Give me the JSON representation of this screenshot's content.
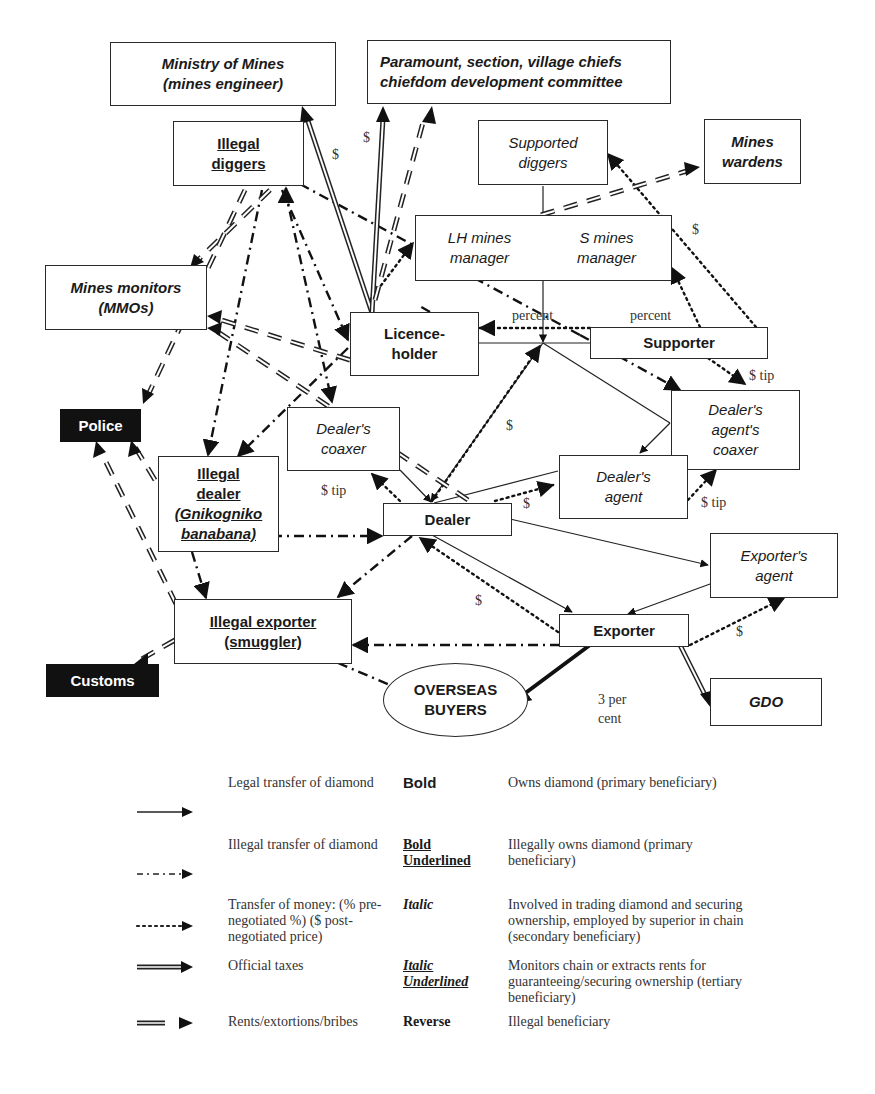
{
  "diagram": {
    "nodes": {
      "ministry": {
        "line1": "Ministry of Mines",
        "line2": "(mines engineer)",
        "style": "italic-bold"
      },
      "chiefs": {
        "line1": "Paramount, section, village chiefs",
        "line2": "chiefdom development committee",
        "style": "italic-bold"
      },
      "illegal_diggers": {
        "line1": "Illegal",
        "line2": "diggers",
        "style": "bold-underlined"
      },
      "supported_diggers": {
        "line1": "Supported",
        "line2": "diggers",
        "style": "italic"
      },
      "mines_wardens": {
        "line1": "Mines",
        "line2": "wardens",
        "style": "italic-bold"
      },
      "lh_mines_manager": {
        "line1": "LH mines",
        "line2": "manager",
        "style": "italic"
      },
      "s_mines_manager": {
        "line1": "S mines",
        "line2": "manager",
        "style": "italic"
      },
      "mines_monitors": {
        "line1": "Mines monitors",
        "line2": "(MMOs)",
        "style": "italic-bold"
      },
      "licence_holder": {
        "line1": "Licence-",
        "line2": "holder",
        "style": "bold"
      },
      "supporter": {
        "line1": "Supporter",
        "style": "bold"
      },
      "police": {
        "line1": "Police",
        "style": "reverse"
      },
      "dealers_coaxer": {
        "line1": "Dealer's",
        "line2": "coaxer",
        "style": "italic"
      },
      "dealers_agents_coaxer": {
        "line1": "Dealer's",
        "line2": "agent's",
        "line3": "coaxer",
        "style": "italic"
      },
      "illegal_dealer": {
        "line1": "Illegal",
        "line2": "dealer",
        "line3": "(Gnikogniko",
        "line4": "banabana)",
        "style": "bold-underlined"
      },
      "dealers_agent": {
        "line1": "Dealer's",
        "line2": "agent",
        "style": "italic"
      },
      "dealer": {
        "line1": "Dealer",
        "style": "bold"
      },
      "exporters_agent": {
        "line1": "Exporter's",
        "line2": "agent",
        "style": "italic"
      },
      "illegal_exporter": {
        "line1": "Illegal exporter",
        "line2": "(smuggler)",
        "style": "bold-underlined"
      },
      "exporter": {
        "line1": "Exporter",
        "style": "bold"
      },
      "customs": {
        "line1": "Customs",
        "style": "reverse"
      },
      "overseas_buyers": {
        "line1": "OVERSEAS",
        "line2": "BUYERS",
        "style": "bold"
      },
      "gdo": {
        "line1": "GDO",
        "style": "italic-bold"
      }
    },
    "edge_labels": {
      "ministry_tax": "$",
      "chiefs_tax": "$",
      "wardens_money": "$",
      "lh_percent": "percent",
      "supporter_percent": "percent",
      "supporter_tip": "$ tip",
      "dealer_money": "$",
      "coaxer_tip": "$ tip",
      "dealer_agent_money": "$",
      "agent_coaxer_tip": "$ tip",
      "exporter_dealer_money": "$",
      "exporter_agent_money": "$",
      "gdo_tax": "3 per cent"
    },
    "edge_types": {
      "legal": {
        "stroke": "#222222",
        "style": "solid"
      },
      "illegal": {
        "stroke": "#111111",
        "style": "dash-dot"
      },
      "money": {
        "stroke": "#111111",
        "style": "dotted"
      },
      "tax": {
        "stroke": "#222222",
        "style": "double"
      },
      "rent": {
        "stroke": "#222222",
        "style": "double-dashed"
      }
    }
  },
  "legend": {
    "rows": [
      {
        "arrow": "legal",
        "description": "Legal transfer of diamond",
        "style_label": "Bold",
        "meaning": "Owns diamond (primary beneficiary)"
      },
      {
        "arrow": "illegal",
        "description": "Illegal transfer of diamond",
        "style_label": "Bold Underlined",
        "meaning": "Illegally owns diamond (primary beneficiary)"
      },
      {
        "arrow": "money",
        "description": "Transfer of money: (% pre-negotiated %) ($ post-negotiated price)",
        "style_label": "Italic",
        "meaning": "Involved in trading diamond and securing ownership, employed by superior in chain (secondary beneficiary)"
      },
      {
        "arrow": "tax",
        "description": "Official taxes",
        "style_label": "Italic Underlined",
        "meaning": "Monitors chain or extracts rents for guaranteeing/securing ownership (tertiary beneficiary)"
      },
      {
        "arrow": "rent",
        "description": "Rents/extortions/bribes",
        "style_label": "Reverse",
        "meaning": "Illegal beneficiary"
      }
    ]
  }
}
